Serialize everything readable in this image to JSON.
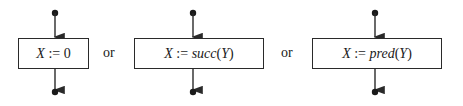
{
  "diagram": {
    "type": "flowchart-alternatives",
    "connector_word": "or",
    "nodes": [
      {
        "id": "assign-zero",
        "var": "X",
        "op": " := ",
        "func": "",
        "arg": "",
        "const": "0",
        "label": "X := 0"
      },
      {
        "id": "assign-succ",
        "var": "X",
        "op": " := ",
        "func": "succ",
        "arg": "Y",
        "const": "",
        "label": "X := succ(Y)"
      },
      {
        "id": "assign-pred",
        "var": "X",
        "op": " := ",
        "func": "pred",
        "arg": "Y",
        "const": "",
        "label": "X := pred(Y)"
      }
    ],
    "separators": [
      "or",
      "or"
    ],
    "colors": {
      "stroke": "#2a2a2a",
      "text": "#1a1a1a",
      "background": "#ffffff"
    }
  }
}
